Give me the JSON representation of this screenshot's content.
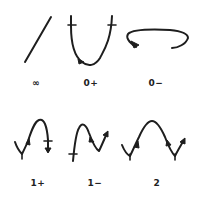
{
  "figure": {
    "title": "",
    "ink_color": "#1e1e1e",
    "background": "#ffffff",
    "panels": [
      {
        "id": "inf",
        "label": "∞",
        "shape": "straight diagonal line"
      },
      {
        "id": "zero-plus",
        "label": "0+",
        "shape": "U-shaped curve with tick marks at both ends and arrow on descending branch"
      },
      {
        "id": "zero-minus",
        "label": "0−",
        "shape": "flattened arc opening downward with arrow on left end"
      },
      {
        "id": "one-plus",
        "label": "1+",
        "shape": "valley then peak, arrows, tick at right end"
      },
      {
        "id": "one-minus",
        "label": "1−",
        "shape": "peak then valley, tick at left end, arrow at right end"
      },
      {
        "id": "two",
        "label": "2",
        "shape": "valley, peak, valley with ticks at both valleys"
      }
    ]
  }
}
